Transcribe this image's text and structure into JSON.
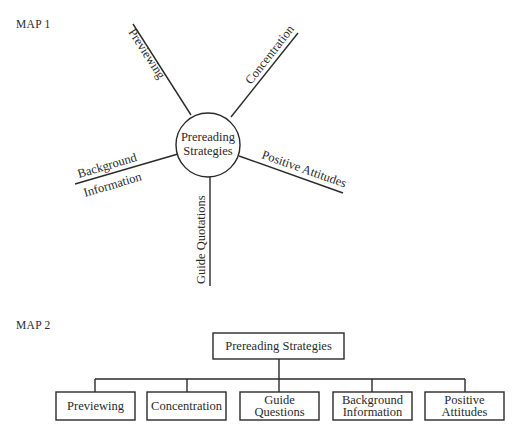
{
  "map1": {
    "title": "MAP 1",
    "center": {
      "line1": "Prereading",
      "line2": "Strategies"
    },
    "branches": [
      {
        "id": "previewing",
        "label": "Previewing"
      },
      {
        "id": "concentration",
        "label": "Concentration"
      },
      {
        "id": "positive-attitudes",
        "label": "Positive Attitudes"
      },
      {
        "id": "guide-quotations",
        "label": "Guide Quotations"
      },
      {
        "id": "background-information",
        "label_top": "Background",
        "label_bottom": "Information"
      }
    ]
  },
  "map2": {
    "title": "MAP 2",
    "root": "Prereading Strategies",
    "children": [
      {
        "line1": "Previewing",
        "line2": ""
      },
      {
        "line1": "Concentration",
        "line2": ""
      },
      {
        "line1": "Guide",
        "line2": "Questions"
      },
      {
        "line1": "Background",
        "line2": "Information"
      },
      {
        "line1": "Positive",
        "line2": "Attitudes"
      }
    ]
  }
}
